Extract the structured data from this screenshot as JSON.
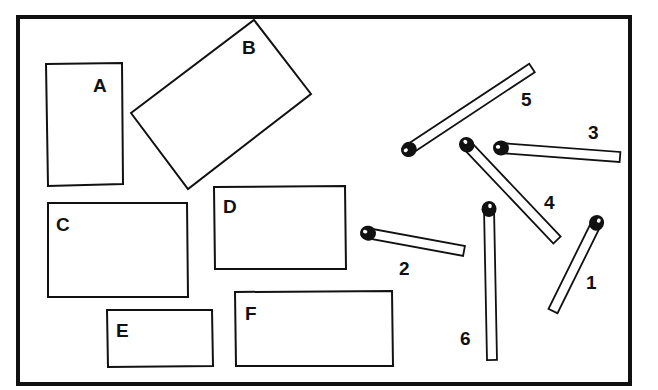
{
  "frame": {
    "x": 18,
    "y": 18,
    "w": 297,
    "h": 182,
    "right": 314,
    "bottom": 200
  },
  "canvas": {
    "width": 658,
    "height": 390,
    "border": {
      "x": 19,
      "y": 19,
      "w": 296,
      "h": 183
    }
  },
  "rectangles": [
    {
      "label": "A",
      "points": "46,64 122,63 123,184 48,186",
      "label_x": 93,
      "label_y": 92
    },
    {
      "label": "B",
      "points": "131,113 254,20 311,94 188,189",
      "label_x": 242,
      "label_y": 54
    },
    {
      "label": "C",
      "points": "48,203 187,203 188,297 48,297",
      "label_x": 56,
      "label_y": 231
    },
    {
      "label": "D",
      "points": "214,187 345,186 346,269 215,269",
      "label_x": 223,
      "label_y": 213
    },
    {
      "label": "E",
      "points": "107,310 212,310 213,366 108,367",
      "label_x": 116,
      "label_y": 337
    },
    {
      "label": "F",
      "points": "235,292 392,291 393,366 236,366",
      "label_x": 245,
      "label_y": 320
    }
  ],
  "matches": [
    {
      "label": "1",
      "head": [
        597,
        222
      ],
      "tail": [
        553,
        311
      ],
      "label_x": 586,
      "label_y": 289
    },
    {
      "label": "2",
      "head": [
        367,
        233
      ],
      "tail": [
        464,
        251
      ],
      "label_x": 399,
      "label_y": 275
    },
    {
      "label": "3",
      "head": [
        500,
        148
      ],
      "tail": [
        620,
        157
      ],
      "label_x": 588,
      "label_y": 139
    },
    {
      "label": "4",
      "head": [
        466,
        144
      ],
      "tail": [
        557,
        240
      ],
      "label_x": 544,
      "label_y": 209
    },
    {
      "label": "5",
      "head": [
        408,
        150
      ],
      "tail": [
        532,
        68
      ],
      "label_x": 521,
      "label_y": 106
    },
    {
      "label": "6",
      "head": [
        489,
        208
      ],
      "tail": [
        492,
        360
      ],
      "label_x": 460,
      "label_y": 345
    }
  ]
}
